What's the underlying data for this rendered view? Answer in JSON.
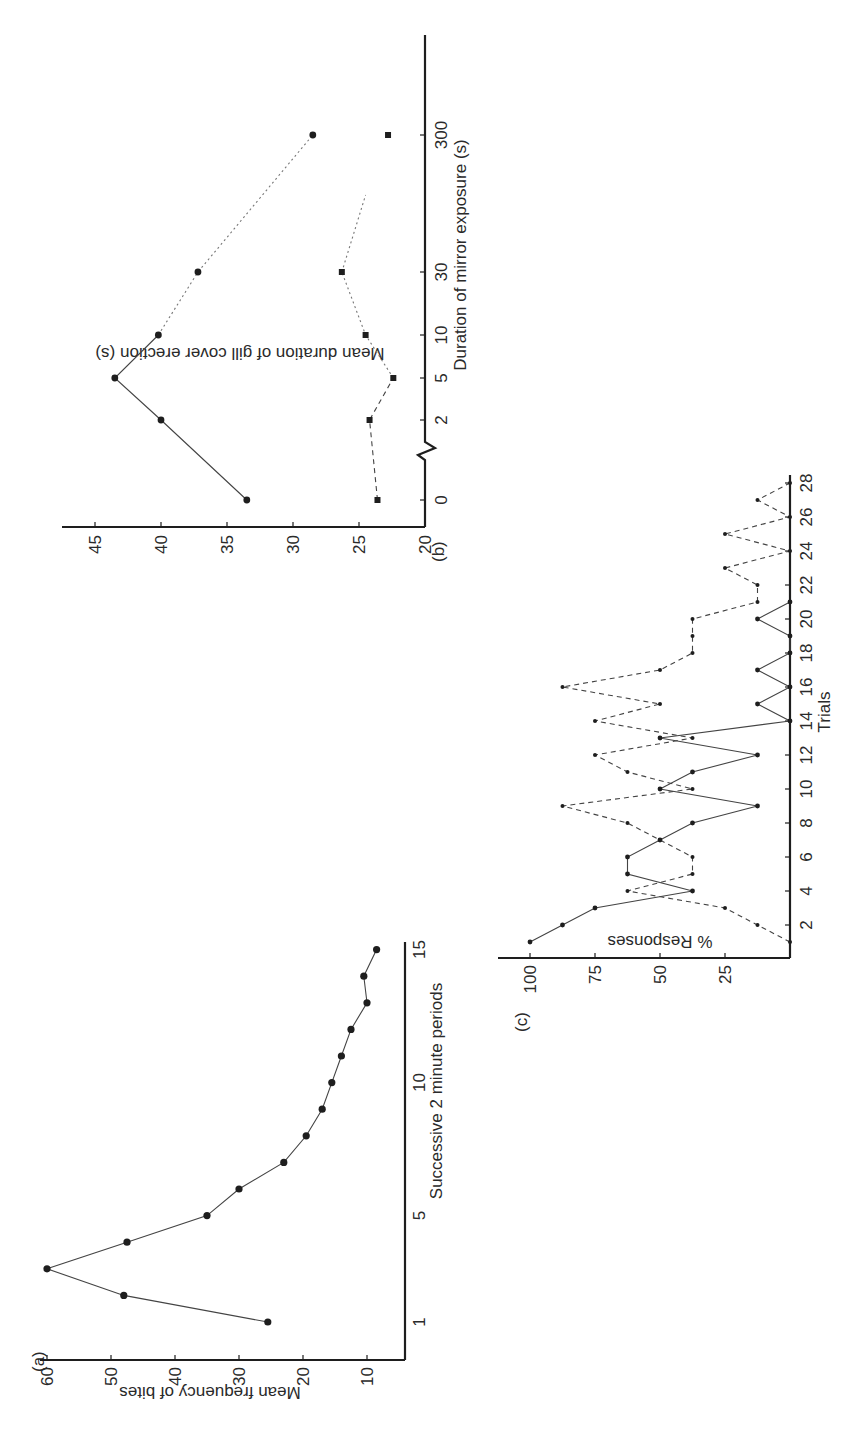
{
  "figure": {
    "orientation": "rotated-90-ccw",
    "panels": [
      "(a)",
      "(b)",
      "(c)"
    ]
  },
  "chart_data": [
    {
      "panel": "(a)",
      "type": "line",
      "title": "",
      "xlabel": "Successive 2 minute periods",
      "ylabel": "Mean frequency of bites",
      "x_ticks": [
        1,
        5,
        10,
        15
      ],
      "y_ticks": [
        10,
        20,
        30,
        40,
        50,
        60
      ],
      "ylim": [
        4,
        60
      ],
      "grid": false,
      "series": [
        {
          "name": "bites",
          "marker": "circle",
          "line": "solid",
          "x": [
            1,
            2,
            3,
            4,
            5,
            6,
            7,
            8,
            9,
            10,
            11,
            12,
            13,
            14,
            15
          ],
          "values": [
            25.5,
            48,
            60,
            47.5,
            35,
            30,
            23,
            19.5,
            17,
            15.5,
            14,
            12.5,
            10,
            10.5,
            8.5
          ]
        }
      ]
    },
    {
      "panel": "(b)",
      "type": "line",
      "title": "",
      "xlabel": "Duration of mirror exposure (s)",
      "ylabel": "Mean duration of gill cover erection (s)",
      "x_ticks": [
        "0",
        "2",
        "5",
        "10",
        "30",
        "300"
      ],
      "x_scale": "log (broken axis after 0)",
      "y_ticks": [
        20,
        25,
        30,
        35,
        40,
        45
      ],
      "ylim": [
        20,
        47
      ],
      "grid": false,
      "series": [
        {
          "name": "circles",
          "marker": "circle",
          "line": "solid/dotted",
          "x": [
            "0",
            "2",
            "5",
            "10",
            "30",
            "300"
          ],
          "values": [
            33.5,
            40,
            43.5,
            40.2,
            37.2,
            28.5
          ]
        },
        {
          "name": "squares",
          "marker": "square",
          "line": "dashed/dotted",
          "x": [
            "0",
            "2",
            "5",
            "10",
            "30",
            "300"
          ],
          "values": [
            23.6,
            24.2,
            22.4,
            24.5,
            26.3,
            22.8
          ]
        }
      ]
    },
    {
      "panel": "(c)",
      "type": "line",
      "title": "",
      "xlabel": "Trials",
      "ylabel": "% Responses",
      "x_ticks": [
        2,
        4,
        6,
        8,
        10,
        12,
        14,
        16,
        18,
        20,
        22,
        24,
        26,
        28
      ],
      "y_ticks": [
        25,
        50,
        75,
        100
      ],
      "ylim": [
        0,
        110
      ],
      "grid": false,
      "series": [
        {
          "name": "solid",
          "line": "solid",
          "x": [
            1,
            2,
            3,
            4,
            5,
            6,
            7,
            8,
            9,
            10,
            11,
            12,
            13,
            14,
            15,
            16,
            17,
            18,
            19,
            20,
            21
          ],
          "values": [
            100,
            87.5,
            75,
            37.5,
            62.5,
            62.5,
            50,
            37.5,
            12.5,
            50,
            37.5,
            12.5,
            50,
            0,
            12.5,
            0,
            12.5,
            0,
            0,
            12.5,
            0
          ]
        },
        {
          "name": "dashed",
          "line": "dashed",
          "x": [
            1,
            2,
            3,
            4,
            5,
            6,
            7,
            8,
            9,
            10,
            11,
            12,
            13,
            14,
            15,
            16,
            17,
            18,
            19,
            20,
            21,
            22,
            23,
            24,
            25,
            26,
            27,
            28
          ],
          "values": [
            0,
            12.5,
            25,
            62.5,
            37.5,
            37.5,
            50,
            62.5,
            87.5,
            37.5,
            62.5,
            75,
            37.5,
            75,
            50,
            87.5,
            50,
            37.5,
            37.5,
            37.5,
            12.5,
            12.5,
            25,
            0,
            25,
            0,
            12.5,
            0
          ]
        }
      ]
    }
  ],
  "labels": {
    "a": {
      "panel": "(a)",
      "xlabel": "Successive 2 minute periods",
      "ylabel": "Mean frequency of bites",
      "x_ticks": [
        "1",
        "5",
        "10",
        "15"
      ],
      "y_ticks": [
        "10",
        "20",
        "30",
        "40",
        "50",
        "60"
      ]
    },
    "b": {
      "panel": "(b)",
      "xlabel": "Duration of mirror exposure (s)",
      "ylabel": "Mean duration of gill cover erection (s)",
      "x_ticks": [
        "0",
        "2",
        "5",
        "10",
        "30",
        "300"
      ],
      "y_ticks": [
        "20",
        "25",
        "30",
        "35",
        "40",
        "45"
      ]
    },
    "c": {
      "panel": "(c)",
      "xlabel": "Trials",
      "ylabel": "% Responses",
      "x_ticks": [
        "2",
        "4",
        "6",
        "8",
        "10",
        "12",
        "14",
        "16",
        "18",
        "20",
        "22",
        "24",
        "26",
        "28"
      ],
      "y_ticks": [
        "25",
        "50",
        "75",
        "100"
      ]
    }
  }
}
